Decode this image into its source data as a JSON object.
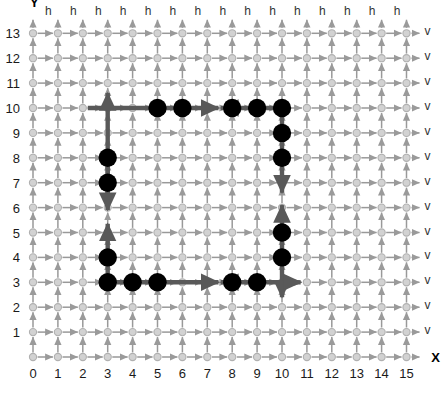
{
  "figure": {
    "axis_x_label": "X",
    "axis_y_label": "Y",
    "x_ticks": [
      "0",
      "1",
      "2",
      "3",
      "4",
      "5",
      "6",
      "7",
      "8",
      "9",
      "10",
      "11",
      "12",
      "13",
      "14",
      "15"
    ],
    "y_ticks": [
      "13",
      "12",
      "11",
      "10",
      "9",
      "8",
      "7",
      "6",
      "5",
      "4",
      "3",
      "2",
      "1"
    ],
    "horizontal_edge_label": "h",
    "vertical_edge_label": "v",
    "h_label_count": 15,
    "v_label_count": 13,
    "colors": {
      "node": "#b3b3b3",
      "edge": "#999999",
      "path": "#595959",
      "marker": "#000000",
      "text": "#1a1a1a",
      "background": "#ffffff"
    }
  },
  "chart_data": {
    "type": "scatter",
    "title": "",
    "xlabel": "X",
    "ylabel": "Y",
    "xlim": [
      0,
      15
    ],
    "ylim": [
      0,
      13
    ],
    "grid": true,
    "legend": "none",
    "nodes_x_range": [
      0,
      15
    ],
    "nodes_y_range": [
      0,
      13
    ],
    "marker_points": [
      {
        "x": 5,
        "y": 10
      },
      {
        "x": 6,
        "y": 10
      },
      {
        "x": 8,
        "y": 10
      },
      {
        "x": 9,
        "y": 10
      },
      {
        "x": 10,
        "y": 10
      },
      {
        "x": 10,
        "y": 9
      },
      {
        "x": 10,
        "y": 8
      },
      {
        "x": 10,
        "y": 5
      },
      {
        "x": 10,
        "y": 4
      },
      {
        "x": 3,
        "y": 8
      },
      {
        "x": 3,
        "y": 7
      },
      {
        "x": 3,
        "y": 4
      },
      {
        "x": 3,
        "y": 3
      },
      {
        "x": 4,
        "y": 3
      },
      {
        "x": 5,
        "y": 3
      },
      {
        "x": 8,
        "y": 3
      },
      {
        "x": 9,
        "y": 3
      }
    ],
    "path_segments": [
      {
        "name": "top-row-left",
        "from": {
          "x": 2.2,
          "y": 10
        },
        "to": {
          "x": 7.45,
          "y": 10
        },
        "arrow": "start"
      },
      {
        "name": "top-row-right",
        "from": {
          "x": 10,
          "y": 10
        },
        "to": {
          "x": 7.55,
          "y": 10
        },
        "arrow": "end"
      },
      {
        "name": "left-col-upper",
        "from": {
          "x": 3,
          "y": 6.2
        },
        "to": {
          "x": 3,
          "y": 10.6
        },
        "arrow": "end"
      },
      {
        "name": "left-col-down",
        "from": {
          "x": 3,
          "y": 8
        },
        "to": {
          "x": 3,
          "y": 5.9
        },
        "arrow": "end"
      },
      {
        "name": "left-col-lower",
        "from": {
          "x": 3,
          "y": 3
        },
        "to": {
          "x": 3,
          "y": 5.35
        },
        "arrow": "end"
      },
      {
        "name": "bottom-row-left",
        "from": {
          "x": 3,
          "y": 3
        },
        "to": {
          "x": 7.45,
          "y": 3
        },
        "arrow": "end"
      },
      {
        "name": "bottom-row-right",
        "from": {
          "x": 10,
          "y": 3
        },
        "to": {
          "x": 7.55,
          "y": 3
        },
        "arrow": "end"
      },
      {
        "name": "right-col-upper",
        "from": {
          "x": 10,
          "y": 10
        },
        "to": {
          "x": 10,
          "y": 6.6
        },
        "arrow": "end"
      },
      {
        "name": "right-col-lower",
        "from": {
          "x": 10,
          "y": 3
        },
        "to": {
          "x": 10,
          "y": 6.1
        },
        "arrow": "end"
      },
      {
        "name": "bottom-right-exit-down",
        "from": {
          "x": 10,
          "y": 3
        },
        "to": {
          "x": 10,
          "y": 2.4
        },
        "arrow": "end"
      },
      {
        "name": "bottom-right-exit-right",
        "from": {
          "x": 10,
          "y": 3
        },
        "to": {
          "x": 10.75,
          "y": 3
        },
        "arrow": "end"
      }
    ]
  }
}
